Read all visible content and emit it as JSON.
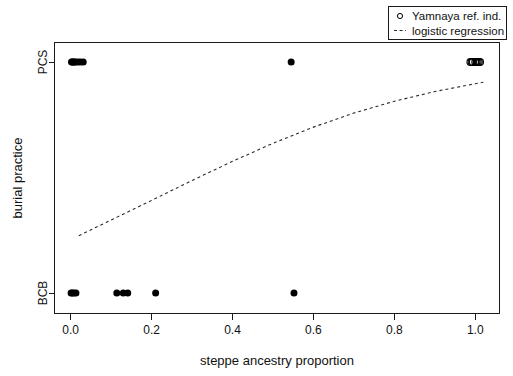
{
  "chart_data": {
    "type": "scatter",
    "title": "",
    "xlabel": "steppe ancestry proportion",
    "ylabel": "burial practice",
    "xlim": [
      -0.04,
      1.06
    ],
    "ylim": [
      0,
      1
    ],
    "xticks": [
      "0.0",
      "0.2",
      "0.4",
      "0.6",
      "0.8",
      "1.0"
    ],
    "xtickvalues": [
      0.0,
      0.2,
      0.4,
      0.6,
      0.8,
      1.0
    ],
    "yticks": [
      "BCB",
      "PCS"
    ],
    "ytickvalues": [
      0,
      1
    ],
    "grid": false,
    "legend_position": "top-right",
    "legend": [
      {
        "label": "Yamnaya ref. ind.",
        "marker": "open-circle"
      },
      {
        "label": "logistic regression",
        "marker": "dashed-line"
      }
    ],
    "series": [
      {
        "name": "observations",
        "marker": "filled-circle",
        "points": [
          {
            "x": 0.002,
            "y": 1
          },
          {
            "x": 0.004,
            "y": 1
          },
          {
            "x": 0.006,
            "y": 1
          },
          {
            "x": 0.009,
            "y": 1
          },
          {
            "x": 0.012,
            "y": 1
          },
          {
            "x": 0.018,
            "y": 1
          },
          {
            "x": 0.024,
            "y": 1
          },
          {
            "x": 0.031,
            "y": 1
          },
          {
            "x": 0.545,
            "y": 1
          },
          {
            "x": 0.001,
            "y": 0
          },
          {
            "x": 0.004,
            "y": 0
          },
          {
            "x": 0.008,
            "y": 0
          },
          {
            "x": 0.013,
            "y": 0
          },
          {
            "x": 0.114,
            "y": 0
          },
          {
            "x": 0.13,
            "y": 0
          },
          {
            "x": 0.141,
            "y": 0
          },
          {
            "x": 0.21,
            "y": 0
          },
          {
            "x": 0.552,
            "y": 0
          }
        ]
      },
      {
        "name": "Yamnaya ref. ind.",
        "marker": "open-circle",
        "points": [
          {
            "x": 0.988,
            "y": 1
          },
          {
            "x": 0.994,
            "y": 1
          },
          {
            "x": 1.0,
            "y": 1
          },
          {
            "x": 1.006,
            "y": 1
          },
          {
            "x": 1.012,
            "y": 1
          },
          {
            "x": 0.991,
            "y": 1
          },
          {
            "x": 1.003,
            "y": 1
          },
          {
            "x": 1.009,
            "y": 1
          }
        ]
      }
    ],
    "fit": {
      "name": "logistic regression",
      "style": "dashed",
      "points": [
        {
          "x": 0.02,
          "y": 0.248
        },
        {
          "x": 0.1,
          "y": 0.316
        },
        {
          "x": 0.2,
          "y": 0.401
        },
        {
          "x": 0.3,
          "y": 0.487
        },
        {
          "x": 0.4,
          "y": 0.57
        },
        {
          "x": 0.5,
          "y": 0.648
        },
        {
          "x": 0.6,
          "y": 0.718
        },
        {
          "x": 0.7,
          "y": 0.779
        },
        {
          "x": 0.8,
          "y": 0.83
        },
        {
          "x": 0.9,
          "y": 0.872
        },
        {
          "x": 1.0,
          "y": 0.906
        },
        {
          "x": 1.02,
          "y": 0.912
        }
      ]
    }
  }
}
